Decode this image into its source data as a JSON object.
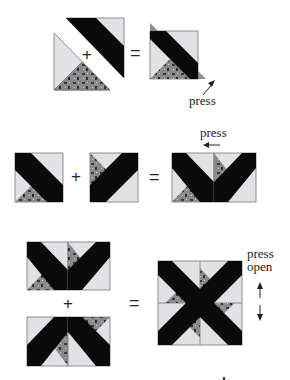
{
  "diagram": {
    "type": "quilt block piecing steps",
    "colors": {
      "background": "#ffffff",
      "light_fabric": "#e2e2e6",
      "print_fabric": "#8a8a8a",
      "strip_fabric": "#0a0a0a",
      "outline": "#777777",
      "text": "#222222"
    },
    "steps": [
      {
        "id": "step1",
        "operators": {
          "plus": "+",
          "equals": "="
        },
        "annotation": "press",
        "arrow": "up-right"
      },
      {
        "id": "step2",
        "operators": {
          "plus": "+",
          "equals": "="
        },
        "annotation": "press",
        "arrow": "left"
      },
      {
        "id": "step3",
        "operators": {
          "plus": "+",
          "equals": "="
        },
        "annotation_line1": "press",
        "annotation_line2": "open",
        "arrows": [
          "up",
          "down"
        ]
      }
    ]
  }
}
